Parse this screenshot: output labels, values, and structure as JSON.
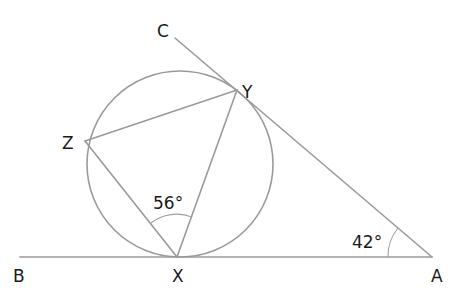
{
  "diagram": {
    "type": "circle-geometry",
    "colors": {
      "lines": "#9a9a9a",
      "text": "#1a1a1a",
      "background": "#ffffff"
    },
    "points": {
      "A": {
        "label": "A"
      },
      "B": {
        "label": "B"
      },
      "C": {
        "label": "C"
      },
      "X": {
        "label": "X"
      },
      "Y": {
        "label": "Y"
      },
      "Z": {
        "label": "Z"
      }
    },
    "angles": {
      "YXZ": {
        "label": "56°",
        "value": 56
      },
      "YAX": {
        "label": "42°",
        "value": 42
      }
    },
    "segments": [
      "BA",
      "CA",
      "XY",
      "XZ",
      "YZ"
    ]
  }
}
